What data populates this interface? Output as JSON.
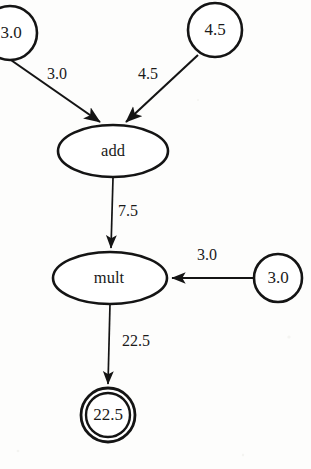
{
  "figure": {
    "kind": "computational-graph",
    "background_color": "#fdfdfc",
    "ink_color": "#141414",
    "expression": "(3.0 + 4.5) * 3.0 = 22.5"
  },
  "nodes": {
    "input_a": {
      "label": "3.0",
      "shape": "circle",
      "clipped_at_left_edge": true,
      "cx": 10,
      "cy": 33,
      "r": 27
    },
    "input_b": {
      "label": "4.5",
      "shape": "circle",
      "cx": 215,
      "cy": 30,
      "r": 27
    },
    "op_add": {
      "label": "add",
      "shape": "ellipse",
      "cx": 113,
      "cy": 151,
      "rx": 55,
      "ry": 26
    },
    "op_mult": {
      "label": "mult",
      "shape": "ellipse",
      "cx": 110,
      "cy": 278,
      "rx": 57,
      "ry": 26
    },
    "input_c": {
      "label": "3.0",
      "shape": "circle",
      "cx": 278,
      "cy": 278,
      "r": 24
    },
    "result": {
      "label": "22.5",
      "shape": "double-circle",
      "cx": 108,
      "cy": 415,
      "r_outer": 27,
      "r_inner": 22
    }
  },
  "edges": [
    {
      "id": "edge-a-add",
      "from": "input_a",
      "to": "op_add",
      "label": "3.0",
      "label_x": 57,
      "label_y": 75
    },
    {
      "id": "edge-b-add",
      "from": "input_b",
      "to": "op_add",
      "label": "4.5",
      "label_x": 148,
      "label_y": 75
    },
    {
      "id": "edge-add-mult",
      "from": "op_add",
      "to": "op_mult",
      "label": "7.5",
      "label_x": 128,
      "label_y": 212
    },
    {
      "id": "edge-c-mult",
      "from": "input_c",
      "to": "op_mult",
      "label": "3.0",
      "label_x": 207,
      "label_y": 256
    },
    {
      "id": "edge-mult-result",
      "from": "op_mult",
      "to": "result",
      "label": "22.5",
      "label_x": 136,
      "label_y": 342
    }
  ]
}
